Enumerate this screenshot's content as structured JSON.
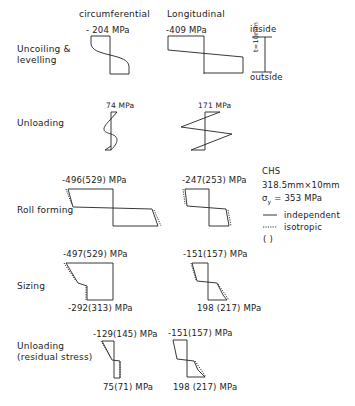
{
  "figure": {
    "column_headers": {
      "circumferential": "circumferential",
      "longitudinal": "Longitudinal"
    },
    "thickness_scale": {
      "top": "inside",
      "bottom": "outside",
      "label": "t=10mm"
    },
    "stages": [
      {
        "name": "Uncoiling &",
        "name2": "levelling",
        "circ_top": "- 204 MPa",
        "long_top": "-409 MPa"
      },
      {
        "name": "Unloading",
        "circ_top": "74 MPa",
        "long_top": "171 MPa"
      },
      {
        "name": "Roll forming",
        "circ_top": "-496(529) MPa",
        "long_top": "-247(253) MPa"
      },
      {
        "name": "Sizing",
        "circ_top": "-497(529) MPa",
        "circ_bottom": "-292(313) MPa",
        "long_top": "-151(157) MPa",
        "long_bottom": "198 (217) MPa"
      },
      {
        "name": "Unloading",
        "name2": "(residual stress)",
        "circ_top": "-129(145) MPa",
        "circ_bottom": "75(71) MPa",
        "long_top": "-151(157) MPa",
        "long_bottom": "198 (217) MPa"
      }
    ],
    "legend": {
      "section": "CHS",
      "dims": "318.5mm×10mm",
      "yield_symbol": "σ",
      "yield_sub": "y",
      "yield_value": "= 353 MPa",
      "solid_label": "independent",
      "dotted_label": "isotropic",
      "paren_label": "( )"
    }
  }
}
